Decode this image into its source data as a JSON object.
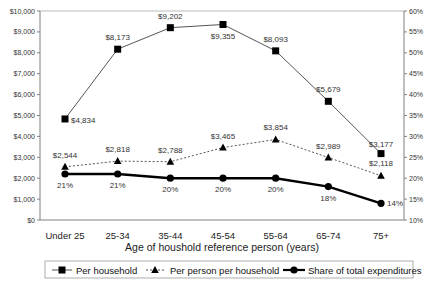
{
  "chart_data": {
    "type": "line",
    "title": "",
    "xlabel": "Age of houshold reference person (years)",
    "ylabel": "",
    "y2label": "",
    "categories": [
      "Under 25",
      "25-34",
      "35-44",
      "45-54",
      "55-64",
      "65-74",
      "75+"
    ],
    "ylim": [
      0,
      10000
    ],
    "y2lim": [
      10,
      60
    ],
    "yticks": [
      "$0",
      "$1,000",
      "$2,000",
      "$3,000",
      "$4,000",
      "$5,000",
      "$6,000",
      "$7,000",
      "$8,000",
      "$9,000",
      "$10,000"
    ],
    "y2ticks": [
      "10%",
      "15%",
      "20%",
      "25%",
      "30%",
      "35%",
      "40%",
      "45%",
      "50%",
      "55%",
      "60%"
    ],
    "grid": false,
    "legend_position": "bottom",
    "series": [
      {
        "name": "Per household",
        "axis": "left",
        "marker": "square",
        "line": "solid-thin",
        "values": [
          4834,
          8173,
          9202,
          9355,
          8093,
          5679,
          3177
        ],
        "labels": [
          "$4,834",
          "$8,173",
          "$9,202",
          "$9,355",
          "$8,093",
          "$5,679",
          "$3,177"
        ]
      },
      {
        "name": "Per person per household",
        "axis": "left",
        "marker": "triangle",
        "line": "dotted",
        "values": [
          2544,
          2818,
          2788,
          3465,
          3854,
          2989,
          2118
        ],
        "labels": [
          "$2,544",
          "$2,818",
          "$2,788",
          "$3,465",
          "$3,854",
          "$2,989",
          "$2,118"
        ]
      },
      {
        "name": "Share of total expenditures",
        "axis": "right",
        "marker": "circle",
        "line": "solid-thick",
        "values": [
          21,
          21,
          20,
          20,
          20,
          18,
          14
        ],
        "labels": [
          "21%",
          "21%",
          "20%",
          "20%",
          "20%",
          "18%",
          "14%"
        ]
      }
    ]
  },
  "colors": {
    "axis": "#808080",
    "series_line": "#555555",
    "marker": "#000000",
    "text": "#333333"
  }
}
